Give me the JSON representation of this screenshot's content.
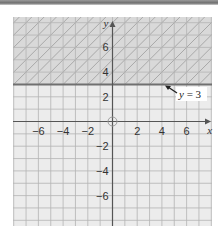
{
  "graph": {
    "x_axis_label": "x",
    "y_axis_label": "y",
    "x_tick_labels": [
      "−6",
      "−4",
      "−2",
      "2",
      "4",
      "6"
    ],
    "x_tick_values": [
      -6,
      -4,
      -2,
      2,
      4,
      6
    ],
    "y_tick_labels": [
      "6",
      "4",
      "2",
      "−2",
      "−4",
      "−6"
    ],
    "y_tick_values": [
      6,
      4,
      2,
      -2,
      -4,
      -6
    ],
    "x_range": [
      -8,
      8
    ],
    "y_range": [
      -8.5,
      8.5
    ],
    "boundary_line": {
      "equation": "y = 3",
      "y": 3
    },
    "shaded_region": "y > 3",
    "annotation": {
      "label": "y = 3"
    },
    "colors": {
      "shaded_bg": "#d9d9d9",
      "unshaded_bg": "#ececec",
      "grid": "#b4b4b4",
      "hatch": "#a8a8a8",
      "axis": "#555555",
      "boundary": "#707070",
      "label_box": "#ffffff"
    }
  }
}
